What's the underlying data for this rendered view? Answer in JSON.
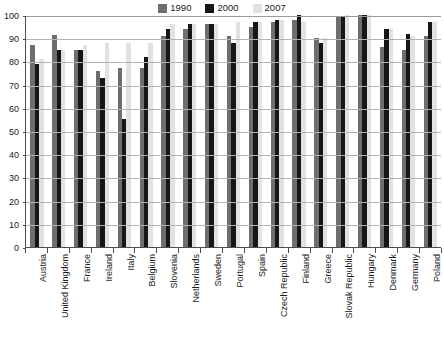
{
  "chart_data": {
    "type": "bar",
    "title": "",
    "subtitle": "",
    "xlabel": "",
    "ylabel": "",
    "ylim": [
      0,
      100
    ],
    "yticks": [
      0,
      10,
      20,
      30,
      40,
      50,
      60,
      70,
      80,
      90,
      100
    ],
    "grid": true,
    "legend_position": "top-center",
    "categories": [
      "Austria",
      "United Kingdom",
      "France",
      "Ireland",
      "Italy",
      "Belgium",
      "Slovenia",
      "Netherlands",
      "Sweden",
      "Portugal",
      "Spain",
      "Czech Republic",
      "Finland",
      "Greece",
      "Slovak Republic",
      "Hungary",
      "Denmark",
      "Germany",
      "Poland"
    ],
    "series": [
      {
        "name": "1990",
        "color": "#6e6e6e",
        "values": [
          87,
          91.5,
          85,
          76,
          77,
          77,
          91,
          94,
          96,
          91,
          95,
          97,
          98,
          90,
          99,
          100,
          86,
          85,
          91
        ]
      },
      {
        "name": "2000",
        "color": "#171717",
        "values": [
          79,
          85,
          85,
          73,
          55,
          82,
          94,
          96,
          96,
          88,
          97,
          98,
          100,
          88,
          99,
          100,
          94,
          92,
          97
        ]
      },
      {
        "name": "2007",
        "color": "#e2e2e2",
        "values": [
          81,
          85,
          87,
          88,
          88,
          88,
          96,
          96,
          96,
          97,
          97,
          98,
          97,
          90,
          100,
          100,
          94,
          91,
          97
        ]
      }
    ]
  },
  "legend": {
    "items": [
      {
        "label": "1990",
        "color": "#6e6e6e"
      },
      {
        "label": "2000",
        "color": "#171717"
      },
      {
        "label": "2007",
        "color": "#e2e2e2"
      }
    ]
  },
  "footer": {
    "note": ""
  }
}
